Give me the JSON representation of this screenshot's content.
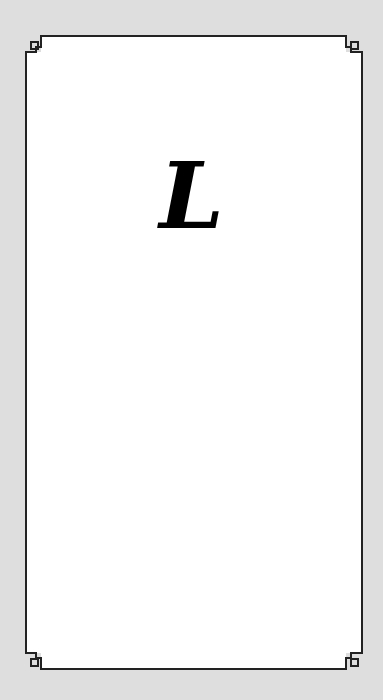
{
  "card": {
    "letter": "L",
    "background_color": "#dedede",
    "panel_color": "#ffffff",
    "border_color": "#222222"
  }
}
